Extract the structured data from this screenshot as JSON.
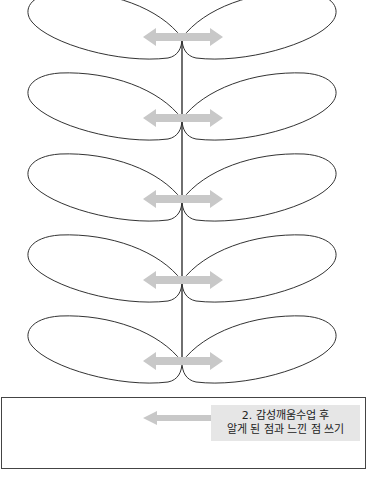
{
  "diagram": {
    "type": "leaf-stem worksheet",
    "leaf_pairs": [
      {
        "index": 1,
        "junction_y": 38
      },
      {
        "index": 2,
        "junction_y": 119
      },
      {
        "index": 3,
        "junction_y": 200
      },
      {
        "index": 4,
        "junction_y": 281
      },
      {
        "index": 5,
        "junction_y": 362
      }
    ],
    "connector": "double-headed-arrow",
    "colors": {
      "outline": "#333333",
      "arrow": "#c8c8c8",
      "label_bg": "#e6e6e6"
    }
  },
  "answer_box": {
    "label": {
      "line1": "2. 감성깨움수업 후",
      "line2": "알게 된 점과 느낀 점 쓰기"
    },
    "arrow": "left-arrow"
  }
}
